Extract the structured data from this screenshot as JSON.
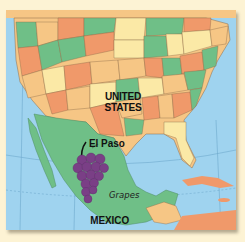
{
  "map": {
    "labels": {
      "country_us_line1": "UNITED",
      "country_us_line2": "STATES",
      "city": "El Paso",
      "country_mexico": "MEXICO",
      "crop": "Grapes"
    },
    "colors": {
      "ocean": "#9fd3ef",
      "state_orange": "#f0996a",
      "state_tan": "#f6c685",
      "state_yellow": "#fbe9a6",
      "state_green": "#6fbf87",
      "mexico_green": "#6fbf87",
      "grape_purple": "#7a3f86",
      "background": "#fdf3d4"
    },
    "marker": {
      "icon": "grapes-icon",
      "location": "Northern Mexico near El Paso"
    }
  }
}
